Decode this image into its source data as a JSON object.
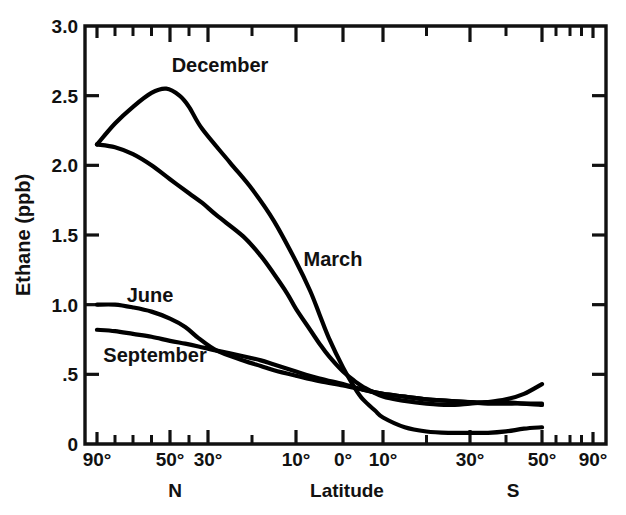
{
  "chart_data": {
    "type": "line",
    "title": "",
    "xlabel": "Latitude",
    "ylabel": "Ethane (ppb)",
    "ylim": [
      0,
      3.0
    ],
    "grid": false,
    "legend": "inline-labels",
    "y_ticks": [
      "0",
      ".5",
      "1.0",
      "1.5",
      "2.0",
      "2.5",
      "3.0"
    ],
    "y_tick_values": [
      0,
      0.5,
      1.0,
      1.5,
      2.0,
      2.5,
      3.0
    ],
    "x_tick_labels": [
      "90°",
      "50°",
      "30°",
      "10°",
      "0°",
      "10°",
      "30°",
      "50°",
      "90°"
    ],
    "x_tick_values": [
      90,
      50,
      30,
      10,
      0,
      -10,
      -30,
      -50,
      -90
    ],
    "hemisphere_labels": {
      "north": "N",
      "south": "S"
    },
    "x_note": "Latitude, degrees North (left) through 0 to degrees South (right); sine-like spacing with 90° compressed at edges",
    "series": [
      {
        "name": "December",
        "label": "December",
        "points": [
          [
            90,
            2.15
          ],
          [
            80,
            2.3
          ],
          [
            70,
            2.42
          ],
          [
            60,
            2.52
          ],
          [
            52,
            2.55
          ],
          [
            45,
            2.5
          ],
          [
            40,
            2.42
          ],
          [
            33,
            2.26
          ],
          [
            25,
            2.02
          ],
          [
            20,
            1.83
          ],
          [
            15,
            1.6
          ],
          [
            10,
            1.31
          ],
          [
            7,
            1.1
          ],
          [
            5,
            0.93
          ],
          [
            3,
            0.76
          ],
          [
            0,
            0.55
          ],
          [
            -3,
            0.4
          ],
          [
            -5,
            0.32
          ],
          [
            -8,
            0.24
          ],
          [
            -10,
            0.19
          ],
          [
            -15,
            0.12
          ],
          [
            -20,
            0.09
          ],
          [
            -25,
            0.08
          ],
          [
            -30,
            0.08
          ],
          [
            -35,
            0.08
          ],
          [
            -40,
            0.09
          ],
          [
            -45,
            0.11
          ],
          [
            -50,
            0.12
          ]
        ]
      },
      {
        "name": "March",
        "label": "March",
        "points": [
          [
            90,
            2.15
          ],
          [
            80,
            2.13
          ],
          [
            70,
            2.08
          ],
          [
            60,
            2.0
          ],
          [
            50,
            1.9
          ],
          [
            40,
            1.8
          ],
          [
            33,
            1.73
          ],
          [
            28,
            1.64
          ],
          [
            22,
            1.49
          ],
          [
            18,
            1.35
          ],
          [
            15,
            1.22
          ],
          [
            12,
            1.08
          ],
          [
            10,
            0.97
          ],
          [
            7,
            0.82
          ],
          [
            5,
            0.72
          ],
          [
            3,
            0.63
          ],
          [
            0,
            0.52
          ],
          [
            -3,
            0.45
          ],
          [
            -5,
            0.41
          ],
          [
            -10,
            0.34
          ],
          [
            -15,
            0.31
          ],
          [
            -20,
            0.29
          ],
          [
            -25,
            0.28
          ],
          [
            -30,
            0.29
          ],
          [
            -35,
            0.3
          ],
          [
            -40,
            0.32
          ],
          [
            -45,
            0.36
          ],
          [
            -50,
            0.43
          ]
        ]
      },
      {
        "name": "June",
        "label": "June",
        "points": [
          [
            90,
            1.0
          ],
          [
            80,
            1.0
          ],
          [
            70,
            0.98
          ],
          [
            60,
            0.95
          ],
          [
            50,
            0.9
          ],
          [
            42,
            0.84
          ],
          [
            35,
            0.76
          ],
          [
            28,
            0.67
          ],
          [
            22,
            0.6
          ],
          [
            18,
            0.56
          ],
          [
            15,
            0.53
          ],
          [
            10,
            0.49
          ],
          [
            5,
            0.45
          ],
          [
            0,
            0.42
          ],
          [
            -5,
            0.39
          ],
          [
            -10,
            0.36
          ],
          [
            -15,
            0.34
          ],
          [
            -20,
            0.32
          ],
          [
            -25,
            0.31
          ],
          [
            -30,
            0.3
          ],
          [
            -35,
            0.3
          ],
          [
            -40,
            0.3
          ],
          [
            -45,
            0.29
          ],
          [
            -50,
            0.29
          ]
        ]
      },
      {
        "name": "September",
        "label": "September",
        "points": [
          [
            90,
            0.82
          ],
          [
            80,
            0.81
          ],
          [
            70,
            0.79
          ],
          [
            60,
            0.77
          ],
          [
            50,
            0.74
          ],
          [
            42,
            0.72
          ],
          [
            35,
            0.7
          ],
          [
            28,
            0.67
          ],
          [
            22,
            0.63
          ],
          [
            18,
            0.6
          ],
          [
            15,
            0.57
          ],
          [
            10,
            0.52
          ],
          [
            5,
            0.47
          ],
          [
            0,
            0.43
          ],
          [
            -5,
            0.39
          ],
          [
            -10,
            0.36
          ],
          [
            -15,
            0.34
          ],
          [
            -20,
            0.32
          ],
          [
            -25,
            0.31
          ],
          [
            -30,
            0.3
          ],
          [
            -35,
            0.29
          ],
          [
            -40,
            0.29
          ],
          [
            -45,
            0.29
          ],
          [
            -50,
            0.28
          ]
        ]
      }
    ],
    "series_label_positions": [
      {
        "name": "December",
        "x": 220,
        "y": 72
      },
      {
        "name": "March",
        "x": 333,
        "y": 266
      },
      {
        "name": "June",
        "x": 150,
        "y": 302
      },
      {
        "name": "September",
        "x": 155,
        "y": 362
      }
    ]
  },
  "axes": {
    "y_title": "Ethane (ppb)",
    "x_title": "Latitude",
    "north": "N",
    "south": "S"
  },
  "colors": {
    "ink": "#111111",
    "curve": "#000000",
    "background": "#ffffff"
  }
}
